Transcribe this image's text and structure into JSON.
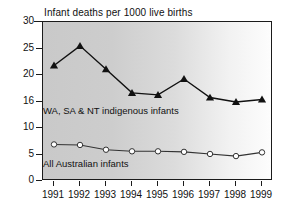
{
  "chart_data": {
    "type": "line",
    "title": "Infant deaths per 1000 live births",
    "xlabel": "",
    "ylabel": "",
    "x": [
      1991,
      1992,
      1993,
      1994,
      1995,
      1996,
      1997,
      1998,
      1999
    ],
    "categories": [
      "1991",
      "1992",
      "1993",
      "1994",
      "1995",
      "1996",
      "1997",
      "1998",
      "1999"
    ],
    "yticks": [
      0,
      5,
      10,
      16,
      20,
      25,
      30
    ],
    "ytick_labels": [
      "0",
      "5",
      "10",
      "16",
      "20",
      "25",
      "30"
    ],
    "ylim": [
      0,
      30
    ],
    "grid": false,
    "legend_position": "in-plot annotations",
    "series": [
      {
        "name": "WA, SA & NT indigenous infants",
        "marker": "filled-triangle",
        "color": "#111111",
        "values": [
          21.8,
          25.5,
          21.1,
          17.3,
          17.0,
          19.4,
          16.6,
          15.9,
          16.3
        ]
      },
      {
        "name": "All Australian infants",
        "marker": "open-circle",
        "color": "#333333",
        "values": [
          6.9,
          6.8,
          5.9,
          5.6,
          5.6,
          5.5,
          5.1,
          4.7,
          5.4
        ]
      }
    ],
    "annotations": [
      {
        "text": "WA, SA & NT indigenous infants",
        "x": 1991,
        "y": 14.5
      },
      {
        "text": "All Australian infants",
        "x": 1991,
        "y": 2.6
      }
    ]
  },
  "colors": {
    "frame": "#1b1b1b",
    "plot_background_left": "#c9c9c9",
    "plot_background_right": "#fdfdfd",
    "text": "#111111"
  }
}
